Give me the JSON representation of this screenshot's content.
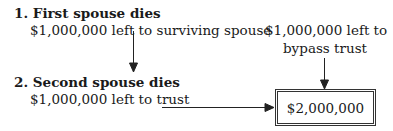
{
  "step1": {
    "heading": "1. First spouse dies",
    "detail": "$1,000,000 left to surviving spouse"
  },
  "step2": {
    "heading": "2. Second spouse dies",
    "detail": "$1,000,000 left to trust"
  },
  "bypass": {
    "line1": "$1,000,000 left to",
    "line2": "bypass trust"
  },
  "total": {
    "value": "$2,000,000"
  }
}
